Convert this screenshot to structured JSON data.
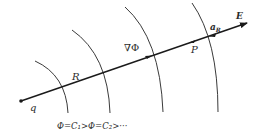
{
  "diagram": {
    "labels": {
      "charge": "q",
      "radius": "R",
      "gradient": "∇Φ",
      "point": "P",
      "unit_vector": "a",
      "unit_vector_sub": "R",
      "field": "E",
      "equipotential_relation": "Φ=C₁>Φ=C₂>···"
    },
    "equipotential_count": 4,
    "colors": {
      "line": "#1a1a1a",
      "arc": "#3a3a3a",
      "text": "#2b2b2b"
    }
  }
}
